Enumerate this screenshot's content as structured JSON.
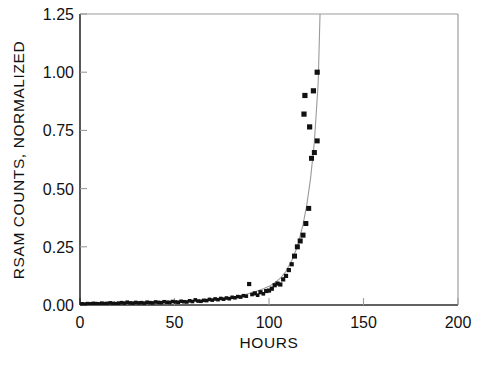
{
  "chart_data": {
    "type": "scatter",
    "title": "",
    "subtitle": "",
    "xlabel": "HOURS",
    "ylabel": "RSAM COUNTS, NORMALIZED",
    "xlim": [
      0,
      200
    ],
    "ylim": [
      0,
      1.25
    ],
    "xticks": [
      0,
      50,
      100,
      150,
      200
    ],
    "yticks": [
      0.0,
      0.25,
      0.5,
      0.75,
      1.0,
      1.25
    ],
    "xtick_labels": [
      "0",
      "50",
      "100",
      "150",
      "200"
    ],
    "ytick_labels": [
      "0.00",
      "0.25",
      "0.50",
      "0.75",
      "1.00",
      "1.25"
    ],
    "grid": false,
    "legend": "none",
    "marker_style": "filled-square",
    "marker_color": "#111111",
    "fit_line_color": "#9a9a9a",
    "axis_color": "#8c8c8c",
    "background_color": "#ffffff",
    "series": [
      {
        "name": "RSAM observations",
        "type": "scatter",
        "marker": "square",
        "x": [
          1,
          2.5,
          4,
          5.5,
          7,
          8.5,
          10,
          11.5,
          13,
          14.5,
          16,
          17.5,
          19,
          20.5,
          22,
          23.5,
          25,
          26.5,
          28,
          29.5,
          31,
          32.5,
          34,
          35.5,
          37,
          38.5,
          40,
          41.5,
          43,
          44.5,
          46,
          47.5,
          49,
          50.5,
          52,
          53.5,
          55,
          56.5,
          58,
          59.5,
          61,
          62.5,
          64,
          65.5,
          67,
          68.5,
          70,
          71.5,
          73,
          74.5,
          76,
          77.5,
          79,
          80.5,
          82,
          83.5,
          85,
          86.5,
          88,
          89.5,
          91,
          92.5,
          94,
          95.5,
          97,
          98.5,
          100,
          101.5,
          103,
          104.5,
          106,
          107.5,
          109,
          110.5,
          112,
          113.5,
          115,
          116.5,
          118,
          119.5,
          121,
          122.5,
          124,
          125.5
        ],
        "y": [
          0.005,
          0.004,
          0.006,
          0.005,
          0.007,
          0.006,
          0.005,
          0.008,
          0.006,
          0.007,
          0.009,
          0.007,
          0.006,
          0.008,
          0.01,
          0.008,
          0.012,
          0.009,
          0.008,
          0.011,
          0.009,
          0.01,
          0.008,
          0.012,
          0.01,
          0.009,
          0.013,
          0.011,
          0.01,
          0.014,
          0.012,
          0.011,
          0.015,
          0.013,
          0.012,
          0.016,
          0.014,
          0.013,
          0.018,
          0.015,
          0.022,
          0.017,
          0.016,
          0.02,
          0.019,
          0.024,
          0.021,
          0.026,
          0.023,
          0.028,
          0.025,
          0.03,
          0.027,
          0.033,
          0.031,
          0.036,
          0.034,
          0.04,
          0.038,
          0.09,
          0.045,
          0.05,
          0.042,
          0.055,
          0.048,
          0.06,
          0.062,
          0.07,
          0.085,
          0.092,
          0.088,
          0.11,
          0.125,
          0.15,
          0.175,
          0.21,
          0.25,
          0.275,
          0.3,
          0.35,
          0.415,
          0.63,
          0.655,
          0.705
        ],
        "outliers": [
          {
            "x": 119.0,
            "y": 0.9
          },
          {
            "x": 118.5,
            "y": 0.82
          },
          {
            "x": 121.5,
            "y": 0.765
          },
          {
            "x": 123.5,
            "y": 0.92
          },
          {
            "x": 125.5,
            "y": 1.0
          }
        ]
      },
      {
        "name": "Exponential fit",
        "type": "line",
        "description": "Smooth accelerating curve rising off the top of the axis near 128 hours",
        "x": [
          0,
          20,
          40,
          55,
          65,
          75,
          82,
          88,
          93,
          97,
          100,
          103,
          106,
          109,
          112,
          115,
          118,
          120,
          122,
          124,
          126,
          127
        ],
        "y": [
          0.004,
          0.006,
          0.01,
          0.015,
          0.02,
          0.028,
          0.036,
          0.046,
          0.058,
          0.07,
          0.08,
          0.095,
          0.115,
          0.145,
          0.19,
          0.25,
          0.345,
          0.43,
          0.545,
          0.7,
          0.95,
          1.25
        ]
      }
    ],
    "annotations": []
  }
}
